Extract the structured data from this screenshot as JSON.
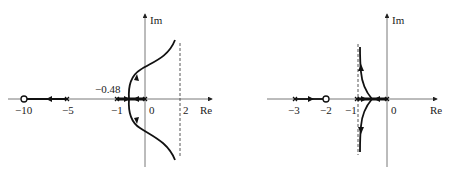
{
  "figure": {
    "left_plot": {
      "axis_labels": {
        "real": "Re",
        "imag": "Im"
      },
      "tick_labels": [
        "−10",
        "−5",
        "−1",
        "0",
        "2"
      ],
      "breakaway_label": "−0.48",
      "zeros": [
        -10
      ],
      "poles": [
        -5,
        -1,
        0,
        0
      ],
      "asymptote": 2
    },
    "right_plot": {
      "axis_labels": {
        "real": "Re",
        "imag": "Im"
      },
      "tick_labels": [
        "−3",
        "−2",
        "−1",
        "0"
      ],
      "zeros": [
        -2
      ],
      "poles": [
        -3,
        -1,
        0,
        0
      ],
      "asymptote": -1
    }
  }
}
